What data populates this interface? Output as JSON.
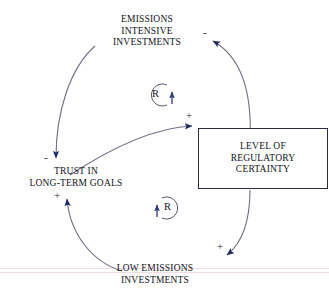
{
  "diagram": {
    "type": "causal-loop-diagram",
    "background_color": "#ffffff",
    "link_color": "#6b7086",
    "arrow_color": "#1f2a63",
    "text_color": "#111118",
    "box_border_color": "#2b2b40",
    "nodes": [
      {
        "id": "emissions-intensive-investments",
        "lines": [
          "EMISSIONS",
          "INTENSIVE",
          "INVESTMENTS"
        ],
        "shape": "text"
      },
      {
        "id": "trust-in-long-term-goals",
        "lines": [
          "TRUST IN",
          "LONG-TERM GOALS"
        ],
        "shape": "text"
      },
      {
        "id": "low-emissions-investments",
        "lines": [
          "LOW EMISSIONS",
          "INVESTMENTS"
        ],
        "shape": "text"
      },
      {
        "id": "level-of-regulatory-certainty",
        "lines": [
          "LEVEL OF",
          "REGULATORY",
          "CERTAINTY"
        ],
        "shape": "rectangle"
      }
    ],
    "links": [
      {
        "id": "regulatory-to-emissions-intensive",
        "from": "level-of-regulatory-certainty",
        "to": "emissions-intensive-investments",
        "polarity": "-"
      },
      {
        "id": "emissions-intensive-to-trust",
        "from": "emissions-intensive-investments",
        "to": "trust-in-long-term-goals",
        "polarity": "-"
      },
      {
        "id": "trust-to-regulatory",
        "from": "trust-in-long-term-goals",
        "to": "level-of-regulatory-certainty",
        "polarity": "+"
      },
      {
        "id": "regulatory-to-low-emissions",
        "from": "level-of-regulatory-certainty",
        "to": "low-emissions-investments",
        "polarity": "+"
      },
      {
        "id": "low-emissions-to-trust",
        "from": "low-emissions-investments",
        "to": "trust-in-long-term-goals",
        "polarity": "+"
      }
    ],
    "loops": [
      {
        "id": "reinforcing-loop-upper",
        "label": "R",
        "type": "reinforcing"
      },
      {
        "id": "reinforcing-loop-lower",
        "label": "R",
        "type": "reinforcing"
      }
    ],
    "polarity_labels": {
      "top_right": "-",
      "into_box": "+",
      "into_trust_top": "-",
      "into_trust_bottom": "+",
      "into_low_emissions": "+"
    }
  }
}
